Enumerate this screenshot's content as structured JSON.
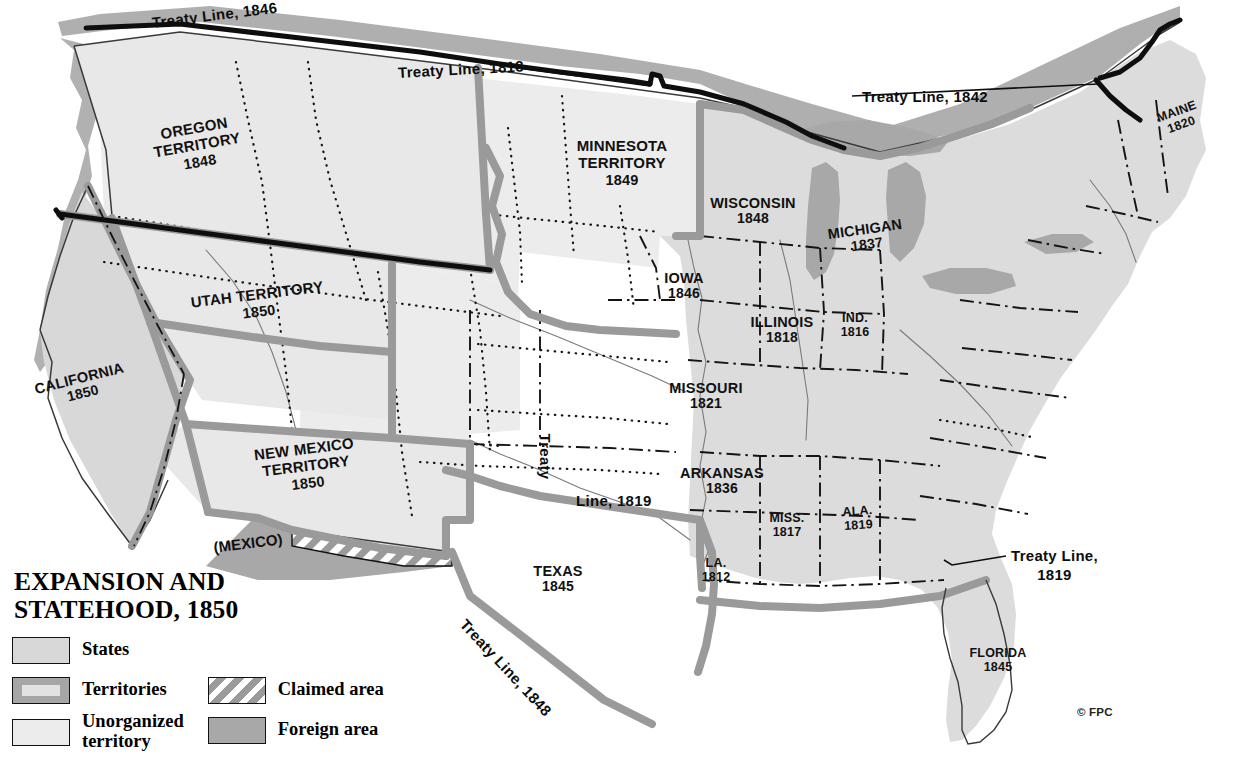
{
  "title": {
    "line1": "EXPANSION AND",
    "line2": "STATEHOOD, 1850"
  },
  "credit": "© FPC",
  "legend": {
    "items": [
      {
        "key": "states",
        "label": "States",
        "label2": "",
        "swatch": "states"
      },
      {
        "key": "territories",
        "label": "Territories",
        "label2": "",
        "swatch": "territories"
      },
      {
        "key": "unorganized",
        "label": "Unorganized",
        "label2": "territory",
        "swatch": "unorganized"
      },
      {
        "key": "claimed",
        "label": "Claimed area",
        "label2": "",
        "swatch": "claimed"
      },
      {
        "key": "foreign",
        "label": "Foreign area",
        "label2": "",
        "swatch": "foreign"
      }
    ]
  },
  "colors": {
    "states_fill": "#dcdcdc",
    "unorganized_fill": "#ececec",
    "foreign_fill": "#a8a8a8",
    "territory_border": "#9a9a9a",
    "outline": "#3a3a3a",
    "treaty_line": "#111111",
    "lake_fill": "#ffffff",
    "page_background": "#ffffff"
  },
  "states": [
    {
      "name": "MAINE",
      "year": "1820",
      "x": 1179,
      "y": 118,
      "rotate": -20,
      "size": "small"
    },
    {
      "name": "WISCONSIN",
      "year": "1848",
      "x": 753,
      "y": 211,
      "rotate": 0,
      "size": "state"
    },
    {
      "name": "MICHIGAN",
      "year": "1837",
      "x": 866,
      "y": 237,
      "rotate": -8,
      "size": "state"
    },
    {
      "name": "IOWA",
      "year": "1846",
      "x": 684,
      "y": 286,
      "rotate": 0,
      "size": "state"
    },
    {
      "name": "ILLINOIS",
      "year": "1818",
      "x": 782,
      "y": 330,
      "rotate": 0,
      "size": "state"
    },
    {
      "name": "IND.",
      "year": "1816",
      "x": 855,
      "y": 325,
      "rotate": 0,
      "size": "small"
    },
    {
      "name": "MISSOURI",
      "year": "1821",
      "x": 706,
      "y": 396,
      "rotate": 0,
      "size": "state"
    },
    {
      "name": "ARKANSAS",
      "year": "1836",
      "x": 722,
      "y": 481,
      "rotate": 0,
      "size": "state"
    },
    {
      "name": "MISS.",
      "year": "1817",
      "x": 787,
      "y": 525,
      "rotate": 0,
      "size": "small"
    },
    {
      "name": "ALA.",
      "year": "1819",
      "x": 858,
      "y": 518,
      "rotate": -4,
      "size": "small"
    },
    {
      "name": "LA.",
      "year": "1812",
      "x": 716,
      "y": 570,
      "rotate": 0,
      "size": "small"
    },
    {
      "name": "TEXAS",
      "year": "1845",
      "x": 558,
      "y": 579,
      "rotate": 0,
      "size": "state"
    },
    {
      "name": "FLORIDA",
      "year": "1845",
      "x": 998,
      "y": 660,
      "rotate": 0,
      "size": "small"
    },
    {
      "name": "CALIFORNIA",
      "year": "1850",
      "x": 81,
      "y": 386,
      "rotate": -14,
      "size": "state"
    }
  ],
  "territories": [
    {
      "name": "OREGON",
      "name2": "TERRITORY",
      "year": "1848",
      "x": 197,
      "y": 145,
      "rotate": -10
    },
    {
      "name": "MINNESOTA",
      "name2": "TERRITORY",
      "year": "1849",
      "x": 622,
      "y": 163,
      "rotate": 0
    },
    {
      "name": "UTAH",
      "name2": "TERRITORY",
      "year": "1850",
      "x": 258,
      "y": 303,
      "rotate": -7,
      "inline": true
    },
    {
      "name": "NEW MEXICO",
      "name2": "TERRITORY",
      "year": "1850",
      "x": 306,
      "y": 466,
      "rotate": -7
    }
  ],
  "treaty_labels": [
    {
      "text": "Treaty Line, 1846",
      "x": 152,
      "y": 14,
      "rotate": -7,
      "lines": 1
    },
    {
      "text": "Treaty Line, 1818",
      "x": 398,
      "y": 64,
      "rotate": -3,
      "lines": 1
    },
    {
      "text": "Treaty Line, 1842",
      "x": 862,
      "y": 88,
      "rotate": 0,
      "lines": 1
    },
    {
      "text": "Treaty",
      "x": 545,
      "y": 425,
      "rotate": 90,
      "lines": 1
    },
    {
      "text": "Line, 1819",
      "x": 576,
      "y": 492,
      "rotate": 0,
      "lines": 1
    },
    {
      "text": "Treaty Line, 1848",
      "x": 463,
      "y": 613,
      "rotate": 47,
      "lines": 1
    },
    {
      "text_line1": "Treaty Line,",
      "text_line2": "1819",
      "x": 1011,
      "y": 547,
      "rotate": 0,
      "lines": 2
    }
  ],
  "foreign_labels": [
    {
      "text": "(MEXICO)",
      "x": 248,
      "y": 543,
      "rotate": -7
    }
  ]
}
